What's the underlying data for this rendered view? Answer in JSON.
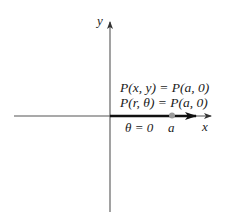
{
  "diagram": {
    "axes": {
      "x_label": "x",
      "y_label": "y"
    },
    "labels": {
      "cartesian_eq": "P(x, y) = P(a, 0)",
      "polar_eq": "P(r, θ) = P(a, 0)",
      "angle": "θ = 0",
      "point": "a"
    },
    "colors": {
      "axis": "#555555",
      "ray": "#1a1a1a",
      "point": "#9a9a9a",
      "text": "#1a1a1a"
    }
  }
}
